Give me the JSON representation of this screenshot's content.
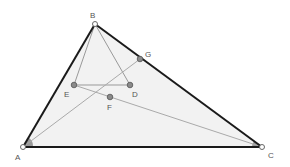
{
  "diagram": {
    "colors": {
      "triangle_fill": "#f2f2f2",
      "triangle_edge": "#1a1a1a",
      "construction_line": "#999999",
      "point_fill": "#8a8a8a",
      "angle_mark": "#9a9a9a",
      "label": "#555555"
    },
    "points": {
      "A": {
        "label": "A",
        "x": 23,
        "y": 147
      },
      "B": {
        "label": "B",
        "x": 95,
        "y": 24
      },
      "C": {
        "label": "C",
        "x": 262,
        "y": 147
      },
      "D": {
        "label": "D",
        "x": 130,
        "y": 85
      },
      "E": {
        "label": "E",
        "x": 74,
        "y": 85
      },
      "F": {
        "label": "F",
        "x": 110,
        "y": 97
      },
      "G": {
        "label": "G",
        "x": 140,
        "y": 59
      }
    },
    "triangle": [
      "A",
      "B",
      "C"
    ],
    "segments": [
      [
        "B",
        "E"
      ],
      [
        "B",
        "D"
      ],
      [
        "E",
        "D"
      ],
      [
        "A",
        "G"
      ],
      [
        "E",
        "C"
      ]
    ]
  }
}
